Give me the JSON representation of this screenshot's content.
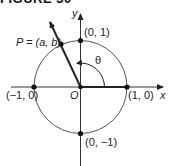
{
  "figure": {
    "title": "FIGURE 30"
  },
  "diagram": {
    "type": "unit-circle",
    "axes": {
      "x_label": "x",
      "y_label": "y",
      "origin_label": "O"
    },
    "points": [
      {
        "label": "(0, 1)"
      },
      {
        "label": "(−1, 0)"
      },
      {
        "label": "(1, 0)"
      },
      {
        "label": "(0, −1)"
      },
      {
        "label": "P = (a, b)"
      }
    ],
    "angle_label": "θ",
    "colors": {
      "line": "#222222",
      "circle": "#555555",
      "axis": "#333333"
    }
  }
}
